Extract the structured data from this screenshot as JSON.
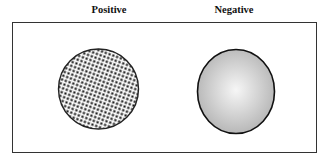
{
  "figure": {
    "panels": [
      {
        "label": "Positive",
        "shape": "circle",
        "fill": "dense-dot-pattern",
        "fill_colors": [
          "#000000",
          "#ffffff"
        ],
        "stroke": "#222222"
      },
      {
        "label": "Negative",
        "shape": "ellipse",
        "fill": "radial-gray-gradient",
        "fill_colors": [
          "#f4f4f4",
          "#b8b8b8"
        ],
        "stroke": "#111111"
      }
    ],
    "frame_color": "#333333"
  }
}
